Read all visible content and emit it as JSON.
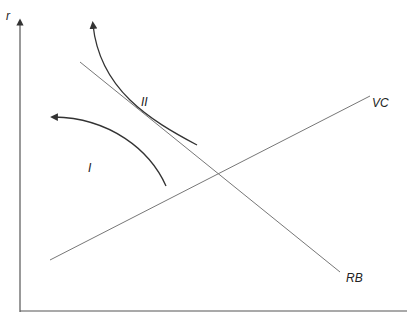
{
  "diagram": {
    "axis_y_label": "r",
    "axis_x_label": "",
    "lines": [
      {
        "name": "RB",
        "label": "RB"
      },
      {
        "name": "VC",
        "label": "VC"
      }
    ],
    "regions": [
      {
        "name": "I",
        "label": "I"
      },
      {
        "name": "II",
        "label": "II"
      }
    ],
    "colors": {
      "axis": "#555555",
      "line": "#777777",
      "curve": "#333333"
    }
  }
}
